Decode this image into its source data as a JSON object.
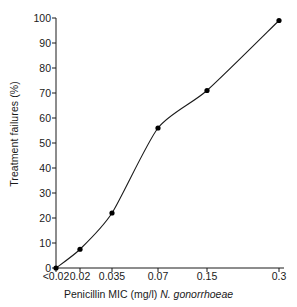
{
  "chart_data": {
    "type": "line",
    "title": "",
    "xlabel": "Penicillin MIC (mg/l) N. gonorrhoeae",
    "xlabel_plain": "Penicillin MIC (mg/l)",
    "xlabel_species": "N. gonorrhoeae",
    "ylabel": "Treatment failures (%)",
    "categories": [
      "<0.02",
      "0.02",
      "0.035",
      "0.07",
      "0.15",
      "0.3"
    ],
    "x_tick_labels": [
      "<0.02",
      "0.02",
      "0.035",
      "0.07",
      "0.15",
      "0.3"
    ],
    "y_tick_labels": [
      "0",
      "10",
      "20",
      "30",
      "40",
      "50",
      "60",
      "70",
      "80",
      "90",
      "100"
    ],
    "y_ticks": [
      0,
      10,
      20,
      30,
      40,
      50,
      60,
      70,
      80,
      90,
      100
    ],
    "values": [
      0,
      7.5,
      22,
      56,
      71,
      99
    ],
    "series": [
      {
        "name": "Treatment failures",
        "values": [
          0,
          7.5,
          22,
          56,
          71,
          99
        ]
      }
    ],
    "ylim": [
      0,
      100
    ],
    "grid": false,
    "legend": false,
    "marker": "filled-circle",
    "line_color": "#1a1a1a",
    "marker_color": "#000000",
    "axis_color": "#1a1a1a",
    "background_color": "#ffffff"
  },
  "axes": {
    "y_title": "Treatment failures (%)",
    "x_title_prefix": "Penicillin MIC (mg/l) ",
    "x_title_species": "N. gonorrhoeae"
  }
}
